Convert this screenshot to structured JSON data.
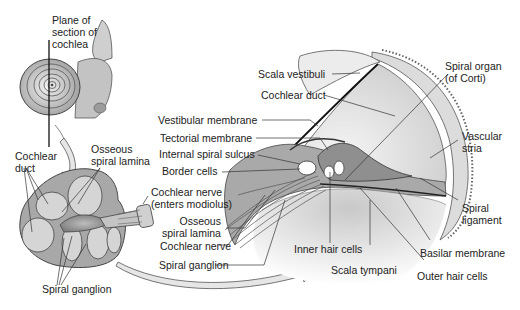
{
  "diagram": {
    "inset_top_left": {
      "label_plane": [
        "Plane of",
        "section of",
        "cochlea"
      ]
    },
    "inset_bottom_left": {
      "labels": {
        "cochlear_duct": [
          "Cochlear",
          "duct"
        ],
        "osseous_spiral_lamina": [
          "Osseous",
          "spiral lamina"
        ],
        "cochlear_nerve_enters": [
          "Cochlear nerve",
          "(enters modiolus)"
        ],
        "spiral_ganglion": "Spiral ganglion"
      }
    },
    "main_section": {
      "labels": {
        "scala_vestibuli": "Scala vestibuli",
        "cochlear_duct": "Cochlear duct",
        "vestibular_membrane": "Vestibular membrane",
        "tectorial_membrane": "Tectorial membrane",
        "internal_spiral_sulcus": "Internal spiral sulcus",
        "border_cells": "Border cells",
        "osseous_spiral_lamina": [
          "Osseous",
          "spiral lamina"
        ],
        "cochlear_nerve": "Cochlear nerve",
        "spiral_ganglion": "Spiral ganglion",
        "inner_hair_cells": "Inner hair cells",
        "scala_tympani": "Scala tympani",
        "outer_hair_cells": "Outer hair cells",
        "basilar_membrane": "Basilar membrane",
        "spiral_ligament": [
          "Spiral",
          "ligament"
        ],
        "vascular_stria": [
          "Vascular",
          "stria"
        ],
        "spiral_organ": [
          "Spiral organ",
          "(of Corti)"
        ]
      }
    },
    "colors": {
      "tissue_light": "#d9d9d9",
      "tissue_mid": "#b8b8b8",
      "tissue_dark": "#8a8a8a",
      "line": "#333333",
      "arrow_fill": "#e6e6e6"
    }
  }
}
